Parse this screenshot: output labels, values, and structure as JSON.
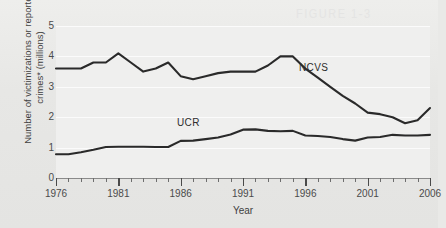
{
  "figure": {
    "ghost_artifact_text": "FIGURE 1-3"
  },
  "chart_data": {
    "type": "line",
    "title": "",
    "xlabel": "Year",
    "ylabel": "Number of victimizations or reported crimes* (millions)",
    "xlim": [
      1976,
      2006
    ],
    "ylim": [
      0,
      5
    ],
    "grid": true,
    "legend_position": "inline-annotation",
    "y_ticks": [
      0,
      1,
      2,
      3,
      4,
      5
    ],
    "x_ticks": [
      1976,
      1981,
      1986,
      1991,
      1996,
      2001,
      2006
    ],
    "x_minor_tick_interval": 1,
    "x": [
      1976,
      1977,
      1978,
      1979,
      1980,
      1981,
      1982,
      1983,
      1984,
      1985,
      1986,
      1987,
      1988,
      1989,
      1990,
      1991,
      1992,
      1993,
      1994,
      1995,
      1996,
      1997,
      1998,
      1999,
      2000,
      2001,
      2002,
      2003,
      2004,
      2005,
      2006
    ],
    "series": [
      {
        "name": "NCVS",
        "label": "NCVS",
        "color": "#2a2a2a",
        "values": [
          3.6,
          3.6,
          3.6,
          3.8,
          3.8,
          4.1,
          3.8,
          3.5,
          3.6,
          3.8,
          3.35,
          3.25,
          3.35,
          3.45,
          3.5,
          3.5,
          3.5,
          3.7,
          4.0,
          4.0,
          3.6,
          3.3,
          3.0,
          2.7,
          2.45,
          2.15,
          2.1,
          2.0,
          1.8,
          1.9,
          2.3
        ]
      },
      {
        "name": "UCR",
        "label": "UCR",
        "color": "#2a2a2a",
        "values": [
          0.78,
          0.78,
          0.85,
          0.93,
          1.02,
          1.03,
          1.03,
          1.03,
          1.02,
          1.02,
          1.22,
          1.23,
          1.28,
          1.33,
          1.43,
          1.59,
          1.6,
          1.55,
          1.54,
          1.55,
          1.4,
          1.38,
          1.35,
          1.28,
          1.23,
          1.33,
          1.35,
          1.42,
          1.4,
          1.4,
          1.42
        ]
      }
    ],
    "annotations": [
      {
        "text": "NCVS",
        "series": "NCVS"
      },
      {
        "text": "UCR",
        "series": "UCR"
      }
    ]
  }
}
